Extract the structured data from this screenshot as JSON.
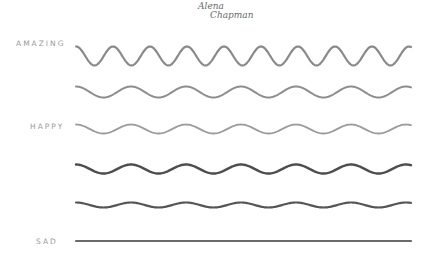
{
  "signature": {
    "line1": "Alena",
    "line2": "Chapman"
  },
  "labels": {
    "amazing": "AMAZING",
    "happy": "HAPPY",
    "sad": "SAD"
  },
  "waves": [
    {
      "name": "amazing",
      "y_center": 56,
      "amplitude": 9.5,
      "period": 37,
      "stroke": "#8a8a8a",
      "width": 2.2
    },
    {
      "name": "level-2",
      "y_center": 92,
      "amplitude": 5.5,
      "period": 55,
      "stroke": "#8e8e8e",
      "width": 2.0
    },
    {
      "name": "happy",
      "y_center": 129,
      "amplitude": 4.5,
      "period": 55,
      "stroke": "#9c9c9c",
      "width": 1.8
    },
    {
      "name": "level-4",
      "y_center": 169,
      "amplitude": 4.5,
      "period": 55,
      "stroke": "#4d4d4d",
      "width": 2.4
    },
    {
      "name": "level-5",
      "y_center": 205,
      "amplitude": 2.5,
      "period": 55,
      "stroke": "#555555",
      "width": 2.2
    },
    {
      "name": "sad",
      "y_center": 241,
      "amplitude": 0,
      "period": 55,
      "stroke": "#6a6a6a",
      "width": 2.2
    }
  ],
  "x_start": 76,
  "x_end": 411
}
